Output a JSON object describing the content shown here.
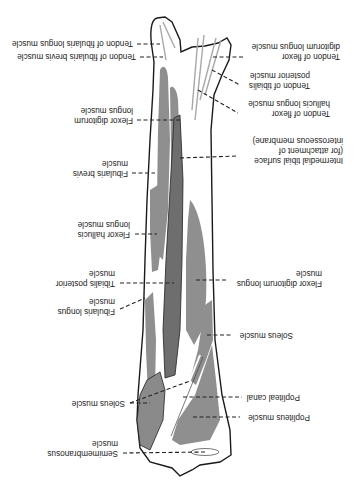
{
  "figure": {
    "orientation": "rotated-180",
    "colors": {
      "bone": "#ffffff",
      "outline": "#1a1a1a",
      "muscle": "#8f8f8f",
      "muscle_dark": "#6e6e6e",
      "tendon": "#a8a8a8"
    }
  },
  "labels": {
    "tendon_fibularis_longus": [
      "Tendon of fibularis longus muscle"
    ],
    "tendon_fibularis_brevis": [
      "Tendon of fibularis brevis muscle"
    ],
    "tendon_flexor_digitorum": [
      "Tendon of flexor",
      "digitorum longus muscle"
    ],
    "tendon_tibialis_posterior": [
      "Tendon of tibialis",
      "posterior muscle"
    ],
    "tendon_flexor_hallucis": [
      "Tendon of flexor",
      "hallucis longus muscle"
    ],
    "flexor_digitorum_upper": [
      "Flexor digitorum",
      "longus muscle"
    ],
    "intermedial_surface": [
      "Intermedial tibial surface",
      "(for attachment of",
      "interosseous membrane)"
    ],
    "fibularis_brevis": [
      "Fibularis brevis",
      "muscle"
    ],
    "flexor_hallucis": [
      "Flexor hallucis",
      "longus muscle"
    ],
    "tibialis_posterior": [
      "Tibialis posterior",
      "muscle"
    ],
    "flexor_digitorum_lower": [
      "Flexor digitorum longus",
      "muscle"
    ],
    "fibularis_longus": [
      "Fibularis longus",
      "muscle"
    ],
    "soleus_right": [
      "Soleus muscle"
    ],
    "soleus_left": [
      "Soleus muscle"
    ],
    "popliteal_canal": [
      "Popliteal canal"
    ],
    "popliteus": [
      "Popliteus muscle"
    ],
    "semimembranosus": [
      "Semimembranosus",
      "muscle"
    ]
  }
}
